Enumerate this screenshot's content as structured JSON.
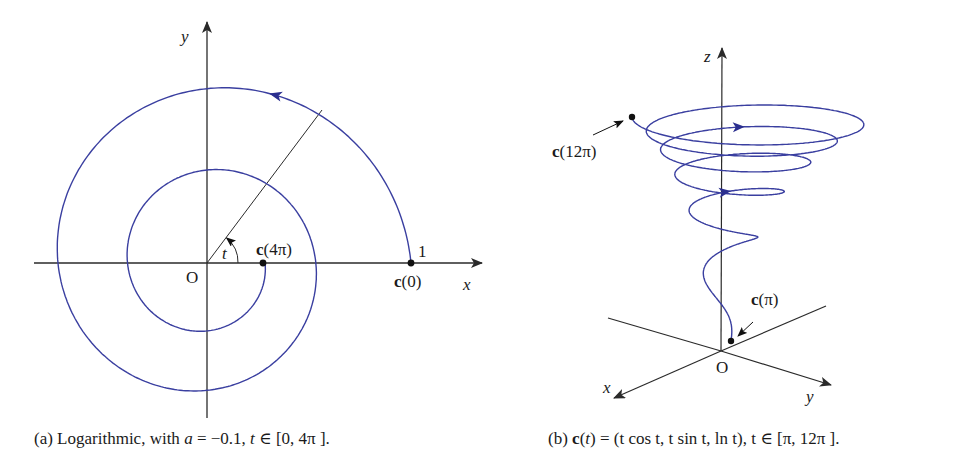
{
  "colors": {
    "curve": "#3a3fa0",
    "axis": "#2a2a2a",
    "point": "#111111",
    "background": "#ffffff"
  },
  "panel_a": {
    "title": "Logarithmic spiral",
    "origin_px": [
      207,
      263
    ],
    "scale_px_per_unit": 204,
    "a": -0.1,
    "t_range": [
      0,
      12.566
    ],
    "labels": {
      "x_axis": "x",
      "y_axis": "y",
      "origin": "O",
      "angle": "t",
      "unit_tick": "1",
      "start_point": "c(0)",
      "end_point": "c(4π)"
    },
    "caption": {
      "prefix": "(a) Logarithmic, with ",
      "var_a": "a",
      "eq": " = −0.1, ",
      "var_t": "t",
      "range": " ∈ [0, 4π ]."
    }
  },
  "panel_b": {
    "title": "Conical spiral",
    "origin_px": [
      721,
      351
    ],
    "t_range": [
      3.1416,
      37.699
    ],
    "labels": {
      "x_axis": "x",
      "y_axis": "y",
      "z_axis": "z",
      "origin": "O",
      "start_point": "c(π)",
      "end_point": "c(12π)"
    },
    "caption": {
      "prefix": "(b) ",
      "func": "c",
      "open": "(",
      "var": "t",
      "rest": ") = (t cos t, t sin t, ln t), t ∈ [π, 12π ]."
    }
  },
  "chart_data": [
    {
      "type": "line",
      "title": "(a) Logarithmic, with a = −0.1, t ∈ [0, 4π].",
      "equation": "c(t) = (e^{at} cos t, e^{at} sin t), a = -0.1",
      "xlabel": "x",
      "ylabel": "y",
      "t_range": [
        0,
        12.566
      ],
      "annotations": [
        {
          "label": "c(0)",
          "x": 1,
          "y": 0
        },
        {
          "label": "c(4π)",
          "x": 0.2846,
          "y": 0
        },
        {
          "label": "1",
          "x": 1,
          "y": 0
        },
        {
          "label": "O",
          "x": 0,
          "y": 0
        },
        {
          "label": "t",
          "note": "angle from x-axis to radial line"
        }
      ],
      "samples": [
        {
          "t": 0,
          "x": 1.0,
          "y": 0.0
        },
        {
          "t": 1.571,
          "x": 0.0,
          "y": 0.855
        },
        {
          "t": 3.1416,
          "x": -0.73,
          "y": 0.0
        },
        {
          "t": 4.712,
          "x": 0.0,
          "y": -0.624
        },
        {
          "t": 6.283,
          "x": 0.533,
          "y": 0.0
        },
        {
          "t": 7.854,
          "x": 0.0,
          "y": 0.456
        },
        {
          "t": 9.425,
          "x": -0.39,
          "y": 0.0
        },
        {
          "t": 10.996,
          "x": 0.0,
          "y": -0.333
        },
        {
          "t": 12.566,
          "x": 0.285,
          "y": 0.0
        }
      ]
    },
    {
      "type": "line",
      "title": "(b) c(t) = (t cos t, t sin t, ln t), t ∈ [π, 12π].",
      "equation": "c(t) = (t cos t, t sin t, ln t)",
      "xlabel": "x",
      "ylabel": "y",
      "zlabel": "z",
      "t_range": [
        3.1416,
        37.699
      ],
      "annotations": [
        {
          "label": "c(π)",
          "x": -3.1416,
          "y": 0,
          "z": 1.1447
        },
        {
          "label": "c(12π)",
          "x": 37.699,
          "y": 0,
          "z": 3.6296
        },
        {
          "label": "O",
          "x": 0,
          "y": 0,
          "z": 0
        }
      ]
    }
  ]
}
